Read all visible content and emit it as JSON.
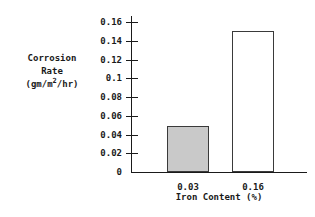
{
  "chart_data": {
    "type": "bar",
    "title": "",
    "categories": [
      "0.03",
      "0.16"
    ],
    "values": [
      0.049,
      0.15
    ],
    "series": [
      {
        "name": "Corrosion Rate",
        "values": [
          0.049,
          0.15
        ]
      }
    ],
    "xlabel": "Iron Content (%)",
    "ylabel_lines": [
      "Corrosion",
      "Rate",
      "(gm/m2/hr)"
    ],
    "ylabel_unit_prefix": "(gm/m",
    "ylabel_unit_sup": "2",
    "ylabel_unit_suffix": "/hr)",
    "ylim": [
      0,
      0.16
    ],
    "ytick_labels": [
      "0.16",
      "0.14",
      "0.12",
      "0.1",
      "0.08",
      "0.06",
      "0.04",
      "0.02",
      "0"
    ],
    "ytick_values": [
      0.16,
      0.14,
      0.12,
      0.1,
      0.08,
      0.06,
      0.04,
      0.02,
      0
    ],
    "xtick_labels": [
      "0.03",
      "0.16"
    ],
    "grid": false,
    "legend": "none",
    "bar_styles": [
      {
        "fill": "#c9c9c9",
        "border": "#3a3a3a"
      },
      {
        "fill": "#ffffff",
        "border": "#3a3a3a"
      }
    ]
  }
}
